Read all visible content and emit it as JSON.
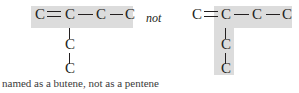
{
  "figure": {
    "caption": "named as a butene, not as a pentene",
    "connective": "not",
    "highlight_color": "#dcdcdc",
    "ink_color": "#231f20",
    "atom_symbol": "C",
    "left_structure": {
      "role": "correct",
      "parent_chain_name": "butene",
      "parent_chain_length": 4,
      "highlight_shape": "horizontal-band",
      "main_chain": [
        "C",
        "C",
        "C",
        "C"
      ],
      "branch_chain": [
        "C",
        "C"
      ],
      "bonds": [
        {
          "from": "C1",
          "to": "C2",
          "order": 2,
          "direction": "horizontal"
        },
        {
          "from": "C2",
          "to": "C3",
          "order": 1,
          "direction": "horizontal"
        },
        {
          "from": "C3",
          "to": "C4",
          "order": 1,
          "direction": "horizontal"
        },
        {
          "from": "C2",
          "to": "B1",
          "order": 1,
          "direction": "vertical"
        },
        {
          "from": "B1",
          "to": "B2",
          "order": 1,
          "direction": "vertical"
        }
      ],
      "atoms": [
        {
          "id": "C1",
          "label": "C",
          "x": 34,
          "y": 11,
          "highlighted": true
        },
        {
          "id": "C2",
          "label": "C",
          "x": 64,
          "y": 11,
          "highlighted": true
        },
        {
          "id": "C3",
          "label": "C",
          "x": 96,
          "y": 11,
          "highlighted": true
        },
        {
          "id": "C4",
          "label": "C",
          "x": 124,
          "y": 11,
          "highlighted": true
        },
        {
          "id": "B1",
          "label": "C",
          "x": 64,
          "y": 40,
          "highlighted": false
        },
        {
          "id": "B2",
          "label": "C",
          "x": 64,
          "y": 64,
          "highlighted": false
        }
      ]
    },
    "right_structure": {
      "role": "incorrect",
      "parent_chain_name": "pentene",
      "parent_chain_length": 5,
      "highlight_shape": "L-shape",
      "main_chain": [
        "C",
        "C",
        "C",
        "C"
      ],
      "branch_chain": [
        "C",
        "C"
      ],
      "bonds": [
        {
          "from": "C1",
          "to": "C2",
          "order": 2,
          "direction": "horizontal"
        },
        {
          "from": "C2",
          "to": "C3",
          "order": 1,
          "direction": "horizontal"
        },
        {
          "from": "C3",
          "to": "C4",
          "order": 1,
          "direction": "horizontal"
        },
        {
          "from": "C2",
          "to": "B1",
          "order": 1,
          "direction": "vertical"
        },
        {
          "from": "B1",
          "to": "B2",
          "order": 1,
          "direction": "vertical"
        }
      ],
      "atoms": [
        {
          "id": "C1",
          "label": "C",
          "x": 191,
          "y": 11,
          "highlighted": false
        },
        {
          "id": "C2",
          "label": "C",
          "x": 220,
          "y": 11,
          "highlighted": true
        },
        {
          "id": "C3",
          "label": "C",
          "x": 252,
          "y": 11,
          "highlighted": true
        },
        {
          "id": "C4",
          "label": "C",
          "x": 281,
          "y": 11,
          "highlighted": true
        },
        {
          "id": "B1",
          "label": "C",
          "x": 220,
          "y": 40,
          "highlighted": true
        },
        {
          "id": "B2",
          "label": "C",
          "x": 220,
          "y": 64,
          "highlighted": true
        }
      ]
    }
  }
}
